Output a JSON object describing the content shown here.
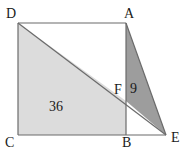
{
  "figure": {
    "type": "geometry-diagram",
    "colors": {
      "background": "#ffffff",
      "outline": "#6b6b6b",
      "light_region_fill": "#dcdcdc",
      "dark_region_fill": "#9d9d9d",
      "label_color": "#1a1a1a"
    },
    "vertices": [
      {
        "name": "D",
        "label": "D",
        "x": 18,
        "y": 23,
        "label_x": 6,
        "label_y": 7
      },
      {
        "name": "A",
        "label": "A",
        "x": 126,
        "y": 23,
        "label_x": 124,
        "label_y": 7
      },
      {
        "name": "C",
        "label": "C",
        "x": 18,
        "y": 135,
        "label_x": 5,
        "label_y": 136
      },
      {
        "name": "B",
        "label": "B",
        "x": 126,
        "y": 135,
        "label_x": 122,
        "label_y": 136
      },
      {
        "name": "E",
        "label": "E",
        "x": 166,
        "y": 135,
        "label_x": 171,
        "label_y": 131
      },
      {
        "name": "F",
        "label": "F",
        "x": 126,
        "y": 101,
        "label_x": 114,
        "label_y": 83
      }
    ],
    "regions": [
      {
        "name": "light-region-DCBF",
        "area_label": "36",
        "fill": "#dcdcdc",
        "points": "18,23 126,101 126,135 18,135"
      },
      {
        "name": "dark-region-AFE",
        "area_label": "9",
        "fill": "#9d9d9d",
        "points": "126,23 126,101 166,135"
      }
    ],
    "segments": [
      {
        "name": "segment-DA",
        "x1": 18,
        "y1": 23,
        "x2": 126,
        "y2": 23
      },
      {
        "name": "segment-DC",
        "x1": 18,
        "y1": 23,
        "x2": 18,
        "y2": 135
      },
      {
        "name": "segment-CB",
        "x1": 18,
        "y1": 135,
        "x2": 126,
        "y2": 135
      },
      {
        "name": "segment-BE",
        "x1": 126,
        "y1": 135,
        "x2": 166,
        "y2": 135
      },
      {
        "name": "segment-AB",
        "x1": 126,
        "y1": 23,
        "x2": 126,
        "y2": 135
      },
      {
        "name": "segment-DE",
        "x1": 18,
        "y1": 23,
        "x2": 166,
        "y2": 135
      },
      {
        "name": "segment-AE",
        "x1": 126,
        "y1": 23,
        "x2": 166,
        "y2": 135
      }
    ],
    "labels": {
      "D": "D",
      "A": "A",
      "C": "C",
      "B": "B",
      "E": "E",
      "F": "F",
      "light_area": "36",
      "dark_area": "9"
    }
  }
}
